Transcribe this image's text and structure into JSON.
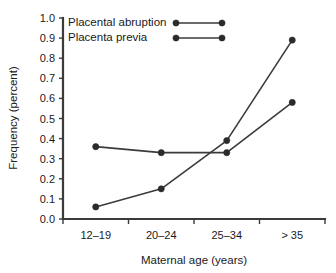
{
  "chart_data": {
    "type": "line",
    "title": "",
    "xlabel": "Maternal age (years)",
    "ylabel": "Frequency (percent)",
    "categories": [
      "12–19",
      "20–24",
      "25–34",
      "> 35"
    ],
    "ylim": [
      0.0,
      1.0
    ],
    "ytick_labels": [
      "0.0",
      "0.1",
      "0.2",
      "0.3",
      "0.4",
      "0.5",
      "0.6",
      "0.7",
      "0.8",
      "0.9",
      "1.0"
    ],
    "ytick_values": [
      0.0,
      0.1,
      0.2,
      0.3,
      0.4,
      0.5,
      0.6,
      0.7,
      0.8,
      0.9,
      1.0
    ],
    "grid": false,
    "legend_position": "top-left",
    "series": [
      {
        "name": "Placental abruption",
        "values": [
          0.36,
          0.33,
          0.33,
          0.58
        ],
        "color": "#3b3b3b",
        "marker": "circle"
      },
      {
        "name": "Placenta previa",
        "values": [
          0.06,
          0.15,
          0.39,
          0.89
        ],
        "color": "#3b3b3b",
        "marker": "circle"
      }
    ]
  },
  "axis": {
    "x_label": "Maternal age (years)",
    "y_label": "Frequency (percent)"
  },
  "legend": {
    "entries": [
      {
        "label": "Placental abruption"
      },
      {
        "label": "Placenta previa"
      }
    ]
  },
  "colors": {
    "axis": "#3b3b3b",
    "series": "#3b3b3b",
    "marker": "#2b2b2b",
    "text": "#1a1a1a",
    "background": "#ffffff"
  }
}
